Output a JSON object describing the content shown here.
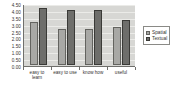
{
  "chart_data": {
    "type": "bar",
    "title": "",
    "subtitle": "",
    "xlabel": "",
    "ylabel": "",
    "categories": [
      "easy to learn",
      "easy to use",
      "know how",
      "useful"
    ],
    "series": [
      {
        "name": "Spatial",
        "values": [
          3.1,
          2.6,
          2.6,
          2.75
        ],
        "color": "#a8a8a5"
      },
      {
        "name": "Textual",
        "values": [
          4.15,
          4.0,
          4.0,
          3.25
        ],
        "color": "#6e6e6b"
      }
    ],
    "ylim": [
      0.0,
      4.5
    ],
    "ytick_labels": [
      "4.50",
      "4.00",
      "3.50",
      "3.00",
      "2.50",
      "2.00",
      "1.50",
      "1.00",
      "0.50",
      "0.00"
    ],
    "ytick_values": [
      4.5,
      4.0,
      3.5,
      3.0,
      2.5,
      2.0,
      1.5,
      1.0,
      0.5,
      0.0
    ],
    "grid": true,
    "legend_position": "right",
    "plot_background": "#d7d7d4",
    "axis_color": "#6f6f6c"
  },
  "legend": {
    "items": [
      {
        "label": "Spatial"
      },
      {
        "label": "Textual"
      }
    ]
  },
  "x_axis": {
    "labels": [
      "easy to learn",
      "easy to use",
      "know how",
      "useful"
    ]
  }
}
